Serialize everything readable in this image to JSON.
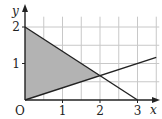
{
  "chart_data": {
    "type": "line",
    "title": "",
    "xlabel": "x",
    "ylabel": "y",
    "xlim": [
      0,
      3.5
    ],
    "ylim": [
      0,
      2.2
    ],
    "grid": true,
    "grid_step": 0.5,
    "xticks": [
      "1",
      "2",
      "3"
    ],
    "xtick_values": [
      1,
      2,
      3
    ],
    "yticks": [
      "1",
      "2"
    ],
    "ytick_values": [
      1,
      2
    ],
    "origin_label": "O",
    "series": [
      {
        "name": "decreasing line",
        "equation": "y = 2 - 2x/3",
        "x": [
          0,
          3
        ],
        "y": [
          2,
          0
        ]
      },
      {
        "name": "increasing line",
        "equation": "y = x/3",
        "x": [
          0,
          3.5
        ],
        "y": [
          0,
          1.1667
        ]
      }
    ],
    "shaded_region": {
      "vertices": [
        [
          0,
          0
        ],
        [
          0,
          2
        ],
        [
          2,
          0.6667
        ]
      ],
      "color": "#b3b3b3"
    },
    "colors": {
      "line": "#222222",
      "grid": "#c8c8c8",
      "shade": "#b3b3b3"
    }
  }
}
